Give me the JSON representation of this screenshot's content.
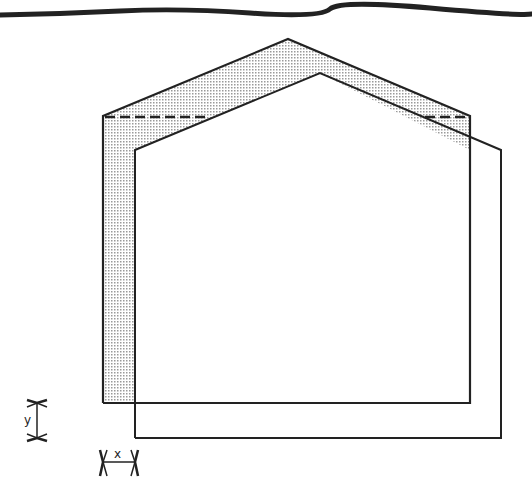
{
  "diagram": {
    "colors": {
      "stroke": "#222222",
      "shade": "#c8c8c8",
      "background": "#ffffff"
    },
    "original_outline": {
      "points": [
        [
          103,
          403
        ],
        [
          103,
          116
        ],
        [
          288,
          39
        ],
        [
          470,
          116
        ],
        [
          470,
          403
        ]
      ]
    },
    "shifted_outline": {
      "points": [
        [
          135,
          438
        ],
        [
          135,
          150
        ],
        [
          320,
          73
        ],
        [
          501,
          150
        ],
        [
          501,
          438
        ]
      ]
    },
    "dimension_labels": {
      "x": "x",
      "y": "y"
    }
  }
}
